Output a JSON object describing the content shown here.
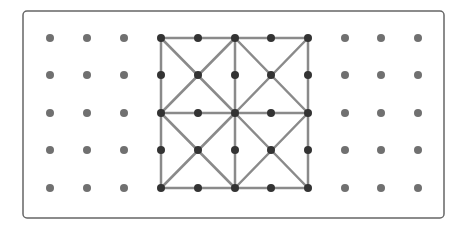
{
  "diagram": {
    "type": "geoboard",
    "frame": {
      "x": 23,
      "y": 11,
      "width": 421,
      "height": 207,
      "radius": 4,
      "stroke": "#666666"
    },
    "grid": {
      "columns": [
        50,
        87,
        124,
        161,
        198,
        235,
        271,
        308,
        345,
        381,
        418
      ],
      "rows": [
        38,
        75,
        113,
        150,
        188
      ],
      "dot_radius": 4,
      "dot_color": "#707070",
      "shape_dot_color": "#333333"
    },
    "shape_region": {
      "col_start": 3,
      "col_end": 7,
      "row_start": 0,
      "row_end": 4
    },
    "line_color": "#8a8a8a",
    "line_width": 2.5,
    "segments": [
      [
        3,
        0,
        7,
        0
      ],
      [
        3,
        4,
        7,
        4
      ],
      [
        3,
        0,
        3,
        4
      ],
      [
        7,
        0,
        7,
        4
      ],
      [
        3,
        2,
        7,
        2
      ],
      [
        5,
        0,
        5,
        4
      ],
      [
        3,
        0,
        5,
        2
      ],
      [
        5,
        0,
        3,
        2
      ],
      [
        5,
        0,
        7,
        2
      ],
      [
        7,
        0,
        5,
        2
      ],
      [
        3,
        2,
        5,
        4
      ],
      [
        5,
        2,
        3,
        4
      ],
      [
        5,
        2,
        7,
        4
      ],
      [
        7,
        2,
        5,
        4
      ]
    ]
  }
}
